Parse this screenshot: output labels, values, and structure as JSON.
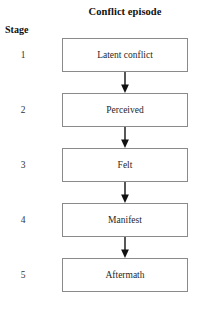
{
  "diagram": {
    "title": "Conflict episode",
    "stage_column_header": "Stage",
    "colors": {
      "box_border": "#8a8a8a",
      "box_fill": "#ffffff",
      "arrow": "#111111",
      "text": "#1f1f1f",
      "background": "#ffffff"
    },
    "flow_direction": "top-to-bottom",
    "stages": [
      {
        "number": "1",
        "label": "Latent conflict"
      },
      {
        "number": "2",
        "label": "Perceived"
      },
      {
        "number": "3",
        "label": "Felt"
      },
      {
        "number": "4",
        "label": "Manifest"
      },
      {
        "number": "5",
        "label": "Aftermath"
      }
    ],
    "connectors": [
      {
        "from": "1",
        "to": "2",
        "icon": "down-arrow-icon"
      },
      {
        "from": "2",
        "to": "3",
        "icon": "down-arrow-icon"
      },
      {
        "from": "3",
        "to": "4",
        "icon": "down-arrow-icon"
      },
      {
        "from": "4",
        "to": "5",
        "icon": "down-arrow-icon"
      }
    ]
  }
}
